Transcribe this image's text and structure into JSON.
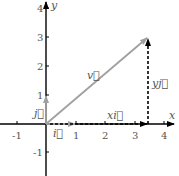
{
  "diagram": {
    "type": "vector-decomposition",
    "axes": {
      "x_label": "x",
      "y_label": "y",
      "x_ticks": [
        "-1",
        "1",
        "2",
        "3",
        "4"
      ],
      "y_ticks": [
        "4",
        "3",
        "2",
        "1",
        "-1"
      ]
    },
    "vectors": {
      "v": {
        "label": "v⃗",
        "from": [
          0,
          0
        ],
        "to": [
          3.5,
          3
        ],
        "color": "#a0a0a0"
      },
      "i": {
        "label": "i⃗",
        "from": [
          0,
          0
        ],
        "to": [
          1,
          0
        ],
        "color": "#a0a0a0"
      },
      "j": {
        "label": "j⃗",
        "from": [
          0,
          0
        ],
        "to": [
          0,
          1
        ],
        "color": "#a0a0a0"
      },
      "xi": {
        "label": "xi⃗",
        "from": [
          0,
          0
        ],
        "to": [
          3.5,
          0
        ],
        "style": "dashed",
        "color": "#000000"
      },
      "yj": {
        "label": "yj⃗",
        "from": [
          3.5,
          0
        ],
        "to": [
          3.5,
          3
        ],
        "style": "dashed",
        "color": "#000000"
      }
    },
    "colors": {
      "axis": "#000000",
      "unit_vectors": "#a0a0a0",
      "component_lines": "#000000",
      "labels": "#555555"
    }
  }
}
